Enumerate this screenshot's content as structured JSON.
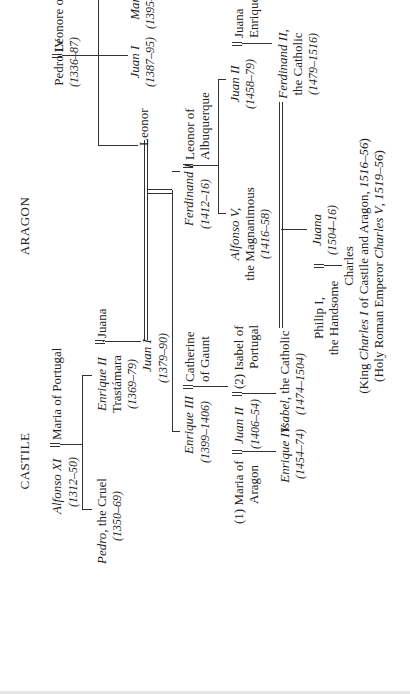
{
  "headings": {
    "castile": "CASTILE",
    "aragon": "ARAGON"
  },
  "people": {
    "alfonso_xi": {
      "name": "Alfonso XI",
      "dates": "(1312–50)"
    },
    "maria_portugal": {
      "name": "Maria of Portugal"
    },
    "pedro_cruel": {
      "name": "Pedro",
      "epithet": ", the Cruel",
      "dates": "(1350–69)"
    },
    "enrique_ii": {
      "name": "Enrique II",
      "line2": "Trastámara",
      "dates": "(1369–79)"
    },
    "juana": {
      "name": "Juana"
    },
    "juan_i_castile": {
      "name": "Juan I",
      "dates": "(1379–90)"
    },
    "leonor": {
      "name": "Leonor"
    },
    "enrique_iii": {
      "name": "Enrique III",
      "dates": "(1399–1406)"
    },
    "catherine_gaunt": {
      "line1": "Catherine",
      "line2": "of Gaunt"
    },
    "maria_aragon": {
      "line1": "(1) Maria of",
      "line2": "Aragon"
    },
    "juan_ii_castile": {
      "name": "Juan II",
      "dates": "(1406–54)"
    },
    "isabel_portugal": {
      "line1": "(2) Isabel of",
      "line2": "Portugal"
    },
    "enrique_iv": {
      "name": "Enrique IV",
      "dates": "(1454–74)"
    },
    "isabel_catholic": {
      "name": "Isabel",
      "epithet": ", the Catholic",
      "dates": "(1474–1504)"
    },
    "pedro_iv": {
      "name": "Pedro IV",
      "dates": "(1336–87)"
    },
    "leonore_sicily": {
      "name": "Leonore of Sicily"
    },
    "juan_i_aragon": {
      "name": "Juan I",
      "dates": "(1387–95)"
    },
    "martin_i": {
      "name": "Martin I",
      "dates": "(1395–1410)"
    },
    "ferdinand_i": {
      "name": "Ferdinand I",
      "dates": "(1412–16)"
    },
    "leonor_albuquerque": {
      "line1": "Leonor of",
      "line2": "Albuquerque"
    },
    "alfonso_v": {
      "name": "Alfonso V,",
      "line2": "the Magnanimous",
      "dates": "(1416–58)"
    },
    "juan_ii_aragon": {
      "name": "Juan II",
      "dates": "(1458–79)"
    },
    "juana_enriquez": {
      "line1": "Juana",
      "line2": "Enriquez"
    },
    "ferdinand_ii": {
      "name": "Ferdinand II,",
      "line2": "the Catholic",
      "dates": "(1479–1516)"
    },
    "juana_mad": {
      "name": "Juana",
      "dates": "(1504–16)"
    },
    "philip_i": {
      "line1": "Philip I,",
      "line2": "the Handsome"
    },
    "charles": {
      "name": "Charles",
      "line2_pre": "(King ",
      "line2_em": "Charles I",
      "line2_post": " of Castile and Aragon, ",
      "line2_dates": "1516–56",
      "line2_end": ")",
      "line3_pre": "(Holy Roman Emperor ",
      "line3_em": "Charles V",
      "line3_post": ", ",
      "line3_dates": "1519–56",
      "line3_end": ")"
    }
  }
}
